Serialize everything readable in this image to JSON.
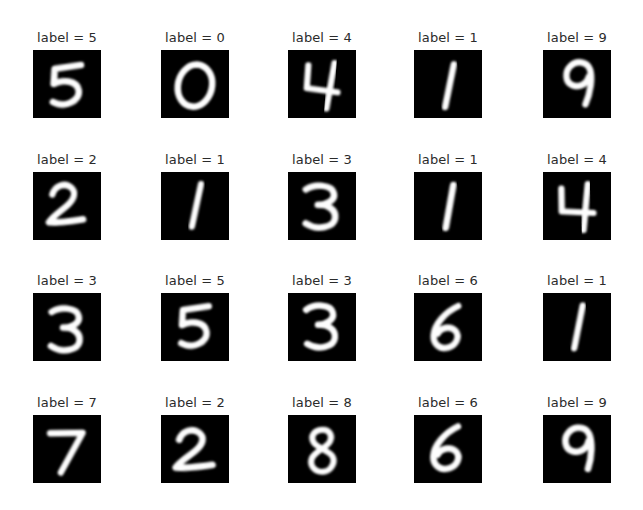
{
  "figure": {
    "type": "image-grid",
    "rows": 4,
    "cols": 5,
    "background_color": "#ffffff",
    "tile_background_color": "#000000",
    "tile_ink_color": "#ffffff",
    "title_color": "#2b2b2b",
    "label_prefix": "label = "
  },
  "chart_data": {
    "type": "table",
    "title": "",
    "rows": 4,
    "cols": 5,
    "labels": [
      5,
      0,
      4,
      1,
      9,
      2,
      1,
      3,
      1,
      4,
      3,
      5,
      3,
      6,
      1,
      7,
      2,
      8,
      6,
      9
    ]
  },
  "cells": [
    {
      "title": "label = 5",
      "value": "5",
      "glyph": "five",
      "name": "digit-image-0",
      "x": 33,
      "y": 50
    },
    {
      "title": "label = 0",
      "value": "0",
      "glyph": "zero",
      "name": "digit-image-1",
      "x": 161,
      "y": 50
    },
    {
      "title": "label = 4",
      "value": "4",
      "glyph": "four",
      "name": "digit-image-2",
      "x": 288,
      "y": 50
    },
    {
      "title": "label = 1",
      "value": "1",
      "glyph": "one",
      "name": "digit-image-3",
      "x": 414,
      "y": 50
    },
    {
      "title": "label = 9",
      "value": "9",
      "glyph": "nine",
      "name": "digit-image-4",
      "x": 543,
      "y": 50
    },
    {
      "title": "label = 2",
      "value": "2",
      "glyph": "two",
      "name": "digit-image-5",
      "x": 33,
      "y": 172
    },
    {
      "title": "label = 1",
      "value": "1",
      "glyph": "one",
      "name": "digit-image-6",
      "x": 161,
      "y": 172
    },
    {
      "title": "label = 3",
      "value": "3",
      "glyph": "three",
      "name": "digit-image-7",
      "x": 288,
      "y": 172
    },
    {
      "title": "label = 1",
      "value": "1",
      "glyph": "one",
      "name": "digit-image-8",
      "x": 414,
      "y": 172
    },
    {
      "title": "label = 4",
      "value": "4",
      "glyph": "four",
      "name": "digit-image-9",
      "x": 543,
      "y": 172
    },
    {
      "title": "label = 3",
      "value": "3",
      "glyph": "three",
      "name": "digit-image-10",
      "x": 33,
      "y": 293
    },
    {
      "title": "label = 5",
      "value": "5",
      "glyph": "five",
      "name": "digit-image-11",
      "x": 161,
      "y": 293
    },
    {
      "title": "label = 3",
      "value": "3",
      "glyph": "three",
      "name": "digit-image-12",
      "x": 288,
      "y": 293
    },
    {
      "title": "label = 6",
      "value": "6",
      "glyph": "six",
      "name": "digit-image-13",
      "x": 414,
      "y": 293
    },
    {
      "title": "label = 1",
      "value": "1",
      "glyph": "one",
      "name": "digit-image-14",
      "x": 543,
      "y": 293
    },
    {
      "title": "label = 7",
      "value": "7",
      "glyph": "seven",
      "name": "digit-image-15",
      "x": 33,
      "y": 415
    },
    {
      "title": "label = 2",
      "value": "2",
      "glyph": "two",
      "name": "digit-image-16",
      "x": 161,
      "y": 415
    },
    {
      "title": "label = 8",
      "value": "8",
      "glyph": "eight",
      "name": "digit-image-17",
      "x": 288,
      "y": 415
    },
    {
      "title": "label = 6",
      "value": "6",
      "glyph": "six",
      "name": "digit-image-18",
      "x": 414,
      "y": 415
    },
    {
      "title": "label = 9",
      "value": "9",
      "glyph": "nine",
      "name": "digit-image-19",
      "x": 543,
      "y": 415
    }
  ]
}
